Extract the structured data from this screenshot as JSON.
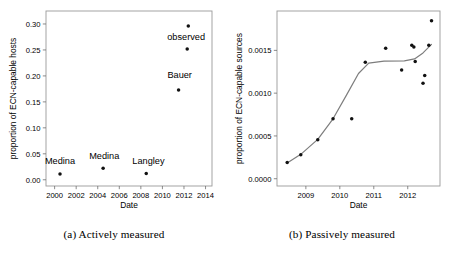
{
  "figure": {
    "panels": [
      {
        "id": "a",
        "caption": "(a) Actively measured",
        "chart_data": {
          "type": "scatter",
          "title": "",
          "xlabel": "Date",
          "ylabel": "proportion of ECN-capable hosts",
          "xlim": [
            1999.2,
            2014.6
          ],
          "ylim": [
            -0.012,
            0.325
          ],
          "xticks": [
            2000,
            2002,
            2004,
            2006,
            2008,
            2010,
            2012,
            2014
          ],
          "xticklabels": [
            "2000",
            "2002",
            "2004",
            "2006",
            "2008",
            "2010",
            "2012",
            "2014"
          ],
          "yticks": [
            0.0,
            0.05,
            0.1,
            0.15,
            0.2,
            0.25,
            0.3
          ],
          "yticklabels": [
            "0.00",
            "0.05",
            "0.10",
            "0.15",
            "0.20",
            "0.25",
            "0.30"
          ],
          "grid": false,
          "legend": "none",
          "points": [
            {
              "x": 2000.5,
              "y": 0.011
            },
            {
              "x": 2004.5,
              "y": 0.022
            },
            {
              "x": 2008.5,
              "y": 0.012
            },
            {
              "x": 2011.5,
              "y": 0.173
            },
            {
              "x": 2012.3,
              "y": 0.252
            },
            {
              "x": 2012.4,
              "y": 0.296
            }
          ],
          "annotations": [
            {
              "text": "Medina",
              "x": 2000.5,
              "y": 0.03,
              "anchor": "middle"
            },
            {
              "text": "Medina",
              "x": 2004.6,
              "y": 0.04,
              "anchor": "middle"
            },
            {
              "text": "Langley",
              "x": 2008.7,
              "y": 0.031,
              "anchor": "middle"
            },
            {
              "text": "Bauer",
              "x": 2011.6,
              "y": 0.196,
              "anchor": "middle"
            },
            {
              "text": "observed",
              "x": 2012.2,
              "y": 0.27,
              "anchor": "middle"
            }
          ]
        }
      },
      {
        "id": "b",
        "caption": "(b) Passively measured",
        "chart_data": {
          "type": "scatter",
          "title": "",
          "xlabel": "Date",
          "ylabel": "proportion of ECN-capable sources",
          "xlim": [
            2008.15,
            2012.95
          ],
          "ylim": [
            -8.5e-05,
            0.00196
          ],
          "xticks": [
            2009,
            2010,
            2011,
            2012
          ],
          "xticklabels": [
            "2009",
            "2010",
            "2011",
            "2012"
          ],
          "yticks": [
            0.0,
            0.0005,
            0.001,
            0.0015
          ],
          "yticklabels": [
            "0.0000",
            "0.0005",
            "0.0010",
            "0.0015"
          ],
          "grid": false,
          "legend": "none",
          "points": [
            {
              "x": 2008.45,
              "y": 0.00019
            },
            {
              "x": 2008.85,
              "y": 0.00028
            },
            {
              "x": 2009.35,
              "y": 0.000455
            },
            {
              "x": 2009.8,
              "y": 0.0007
            },
            {
              "x": 2010.35,
              "y": 0.0007
            },
            {
              "x": 2010.75,
              "y": 0.00136
            },
            {
              "x": 2011.35,
              "y": 0.001525
            },
            {
              "x": 2011.82,
              "y": 0.00127
            },
            {
              "x": 2012.12,
              "y": 0.00156
            },
            {
              "x": 2012.18,
              "y": 0.00154
            },
            {
              "x": 2012.22,
              "y": 0.00137
            },
            {
              "x": 2012.45,
              "y": 0.001115
            },
            {
              "x": 2012.5,
              "y": 0.001205
            },
            {
              "x": 2012.62,
              "y": 0.00156
            },
            {
              "x": 2012.7,
              "y": 0.001845
            }
          ],
          "trend_line": [
            {
              "x": 2008.45,
              "y": 0.000185
            },
            {
              "x": 2008.85,
              "y": 0.000285
            },
            {
              "x": 2009.35,
              "y": 0.00046
            },
            {
              "x": 2009.8,
              "y": 0.0007
            },
            {
              "x": 2010.2,
              "y": 0.00098
            },
            {
              "x": 2010.55,
              "y": 0.00123
            },
            {
              "x": 2010.85,
              "y": 0.00135
            },
            {
              "x": 2011.3,
              "y": 0.001375
            },
            {
              "x": 2011.9,
              "y": 0.001378
            },
            {
              "x": 2012.2,
              "y": 0.0014
            },
            {
              "x": 2012.45,
              "y": 0.00147
            },
            {
              "x": 2012.7,
              "y": 0.00157
            }
          ],
          "annotations": []
        }
      }
    ]
  }
}
